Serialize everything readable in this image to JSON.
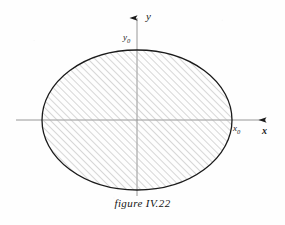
{
  "figure": {
    "caption": "figure IV.22",
    "background_color": "#fefefe",
    "ink_color": "#1a1a1a",
    "axis_color": "#8c8c8c",
    "hatch_color": "#b0b0b0",
    "outline_color": "#1a1a1a"
  },
  "axes": {
    "x_axis": {
      "label": "x",
      "arrow": "arrow-right",
      "start_x": 16,
      "end_x": 272,
      "y": 120
    },
    "y_axis": {
      "label": "y",
      "arrow": "arrow-up",
      "x": 137,
      "top_y": 12,
      "bottom_y": 196
    },
    "origin": {
      "x": 137,
      "y": 120
    }
  },
  "markers": {
    "x_intercept_label": "x",
    "x_intercept_subscript": "0",
    "y_intercept_label": "y",
    "y_intercept_subscript": "0",
    "y_axis_label": "y",
    "x_axis_label": "x"
  },
  "shape": {
    "type": "ellipse",
    "center_x": 137,
    "center_y": 120,
    "radius_x": 95,
    "radius_y": 70,
    "fill": "hatched",
    "hatch_angle_degrees": 45,
    "hatch_spacing_px": 5,
    "stroke_width": 1.3
  }
}
